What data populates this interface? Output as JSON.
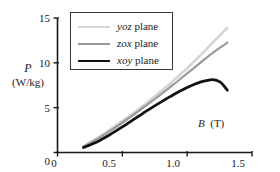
{
  "chart_data": {
    "type": "line",
    "title": "",
    "xlabel": "B (T)",
    "xlabel_symbol": "B",
    "xlabel_unit": "(T)",
    "ylabel": "P (W/kg)",
    "ylabel_symbol": "P",
    "ylabel_unit": "(W/kg)",
    "xlim": [
      0,
      1.5
    ],
    "ylim": [
      0,
      15
    ],
    "xticks": [
      0,
      0.5,
      1.0,
      1.5
    ],
    "xtick_labels": [
      "0",
      "0.5",
      "1.0",
      "1.5"
    ],
    "yticks": [
      0,
      5,
      10,
      15
    ],
    "ytick_labels": [
      "0",
      "5",
      "10",
      "15"
    ],
    "grid": false,
    "legend_position": "upper-left",
    "series": [
      {
        "name": "yoz plane",
        "name_italic": "yoz",
        "name_rest": " plane",
        "color": "#d4d4d4",
        "width": 2.6,
        "x": [
          0.2,
          0.3,
          0.4,
          0.5,
          0.6,
          0.7,
          0.8,
          0.9,
          1.0,
          1.1,
          1.2,
          1.31
        ],
        "y": [
          0.7,
          1.55,
          2.5,
          3.5,
          4.55,
          5.65,
          6.85,
          8.1,
          9.4,
          10.8,
          12.3,
          13.9
        ]
      },
      {
        "name": "zox plane",
        "name_italic": "zox",
        "name_rest": " plane",
        "color": "#9a9a9a",
        "width": 2.2,
        "x": [
          0.2,
          0.3,
          0.4,
          0.5,
          0.6,
          0.7,
          0.8,
          0.9,
          1.0,
          1.1,
          1.2,
          1.31
        ],
        "y": [
          0.65,
          1.45,
          2.35,
          3.32,
          4.35,
          5.42,
          6.52,
          7.65,
          8.82,
          10.0,
          11.15,
          12.25
        ]
      },
      {
        "name": "xoy plane",
        "name_italic": "xoy",
        "name_rest": " plane",
        "color": "#121212",
        "width": 2.8,
        "x": [
          0.2,
          0.3,
          0.4,
          0.5,
          0.6,
          0.7,
          0.8,
          0.9,
          1.0,
          1.1,
          1.18,
          1.22,
          1.26,
          1.31
        ],
        "y": [
          0.55,
          1.15,
          1.95,
          2.85,
          3.8,
          4.75,
          5.65,
          6.5,
          7.25,
          7.85,
          8.1,
          8.08,
          7.8,
          6.95
        ]
      }
    ]
  },
  "axes": {
    "y_title_line1": "P",
    "y_title_line2": "(W/kg)",
    "x_title_symbol": "B",
    "x_title_unit": "(T)"
  },
  "legend": {
    "items": [
      {
        "label_italic": "yoz",
        "label_rest": " plane",
        "color": "#d4d4d4"
      },
      {
        "label_italic": "zox",
        "label_rest": " plane",
        "color": "#9a9a9a"
      },
      {
        "label_italic": "xoy",
        "label_rest": " plane",
        "color": "#121212"
      }
    ]
  },
  "ticks": {
    "x": [
      {
        "label": "0",
        "left": 53
      },
      {
        "label": "0.5",
        "left": 108
      },
      {
        "label": "1.0",
        "left": 172
      },
      {
        "label": "1.5",
        "left": 237
      }
    ],
    "y": [
      {
        "label": "0",
        "top": 156
      },
      {
        "label": "5",
        "top": 103
      },
      {
        "label": "10",
        "top": 58
      },
      {
        "label": "15",
        "top": 13
      }
    ]
  }
}
